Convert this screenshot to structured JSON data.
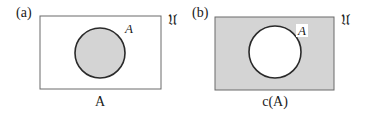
{
  "colors": {
    "stroke": "#2a2a2a",
    "box_stroke": "#6a6a6a",
    "shade": "#d4d4d4",
    "background": "#ffffff"
  },
  "panels": [
    {
      "id": "a",
      "label": "(a)",
      "universe_label": "ű",
      "universe_symbol": "U",
      "set_label": "A",
      "caption": "A",
      "shaded_region": "inside circle",
      "box": {
        "x": 40,
        "y": 16,
        "w": 121,
        "h": 73
      },
      "circle": {
        "cx": 100,
        "cy": 53,
        "r": 25
      }
    },
    {
      "id": "b",
      "label": "(b)",
      "universe_label": "ű",
      "universe_symbol": "U",
      "set_label": "A",
      "caption": "c(A)",
      "shaded_region": "outside circle (complement)",
      "box": {
        "x": 215,
        "y": 17,
        "w": 119,
        "h": 73
      },
      "circle": {
        "cx": 275,
        "cy": 52,
        "r": 26
      }
    }
  ],
  "text": {
    "panel_a_label": "(a)",
    "panel_b_label": "(b)",
    "universe_a": "𝔘",
    "universe_b": "𝔘",
    "set_a": "A",
    "set_b": "A",
    "caption_a": "A",
    "caption_b": "c(A)"
  }
}
